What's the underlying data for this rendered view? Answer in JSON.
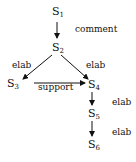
{
  "nodes": [
    {
      "id": "S1",
      "base": "S",
      "sub": "1"
    },
    {
      "id": "S2",
      "base": "S",
      "sub": "2"
    },
    {
      "id": "S3",
      "base": "S",
      "sub": "3"
    },
    {
      "id": "S4",
      "base": "S",
      "sub": "4"
    },
    {
      "id": "S5",
      "base": "S",
      "sub": "5"
    },
    {
      "id": "S6",
      "base": "S",
      "sub": "6"
    }
  ],
  "edges": [
    {
      "from": "S1",
      "to": "S2",
      "label": "comment"
    },
    {
      "from": "S2",
      "to": "S3",
      "label": "elab"
    },
    {
      "from": "S2",
      "to": "S4",
      "label": "elab"
    },
    {
      "from": "S3",
      "to": "S4",
      "label": "support"
    },
    {
      "from": "S4",
      "to": "S5",
      "label": "elab"
    },
    {
      "from": "S5",
      "to": "S6",
      "label": "elab"
    }
  ]
}
